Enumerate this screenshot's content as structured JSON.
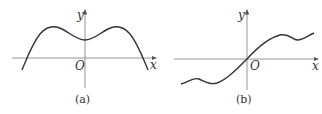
{
  "panels": [
    {
      "id": "a",
      "caption": "(a)",
      "x_axis_label": "x",
      "y_axis_label": "y",
      "origin_label": "O",
      "description": "Even function: two symmetric maxima, local minimum at x=0 above axis, crosses x-axis at two symmetric points"
    },
    {
      "id": "b",
      "caption": "(b)",
      "x_axis_label": "x",
      "y_axis_label": "y",
      "origin_label": "O",
      "description": "Odd function: passes through origin, wavy increasing curve with local max/min pairs symmetric about origin"
    }
  ],
  "colors": {
    "axis": "#888888",
    "curve": "#333333",
    "text": "#333333"
  }
}
